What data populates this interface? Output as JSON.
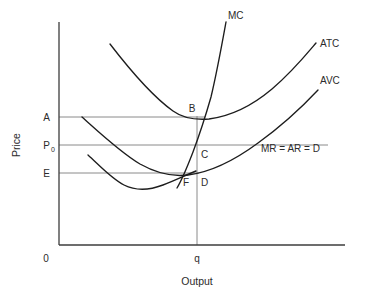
{
  "figure": {
    "type": "economics-cost-curve-diagram",
    "axes": {
      "origin_label": "0",
      "y_axis_title": "Price",
      "x_axis_title": "Output",
      "x_tick_label": "q"
    },
    "price_levels": [
      {
        "id": "A",
        "label": "A",
        "y": 117
      },
      {
        "id": "P0",
        "label": "P",
        "sub": "0",
        "y": 145
      },
      {
        "id": "E",
        "label": "E",
        "y": 173
      }
    ],
    "curves": [
      {
        "id": "MC",
        "label": "MC"
      },
      {
        "id": "ATC",
        "label": "ATC"
      },
      {
        "id": "AVC",
        "label": "AVC"
      }
    ],
    "revenue_line": {
      "label": "MR = AR = D"
    },
    "points": [
      {
        "id": "B",
        "label": "B"
      },
      {
        "id": "C",
        "label": "C"
      },
      {
        "id": "D",
        "label": "D"
      },
      {
        "id": "F",
        "label": "F"
      }
    ],
    "colors": {
      "curve": "#1d1d1d",
      "axis": "#3c3c3c",
      "guide": "#8a8a8a",
      "text": "#2b2b2b",
      "background": "#ffffff"
    }
  }
}
